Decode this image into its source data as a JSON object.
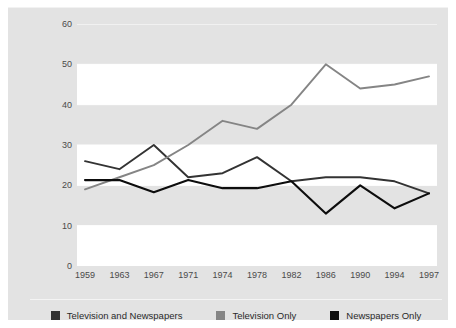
{
  "caption": "",
  "chart_data": {
    "type": "line",
    "title": "",
    "xlabel": "",
    "ylabel": "Percentage",
    "categories": [
      "1959",
      "1963",
      "1967",
      "1971",
      "1974",
      "1978",
      "1982",
      "1986",
      "1990",
      "1994",
      "1997"
    ],
    "x_tick_labels": [
      "1959",
      "1963",
      "1967",
      "1971",
      "1974",
      "1978",
      "1982",
      "1986",
      "1990",
      "1994",
      "1997"
    ],
    "y_tick_labels": [
      "0",
      "10",
      "20",
      "30",
      "40",
      "50",
      "60"
    ],
    "y_ticks": [
      0,
      10,
      20,
      30,
      40,
      50,
      60
    ],
    "ylim": [
      0,
      60
    ],
    "grid": "horizontal-bands",
    "legend_position": "bottom",
    "series": [
      {
        "name": "Television and Newspapers",
        "color": "#333333",
        "values": [
          26,
          24,
          30,
          22,
          23,
          27,
          21,
          22,
          22,
          21,
          18
        ]
      },
      {
        "name": "Television Only",
        "color": "#858585",
        "values": [
          19,
          22,
          25,
          30,
          36,
          34,
          40,
          50,
          44,
          45,
          47
        ]
      },
      {
        "name": "Newspapers Only",
        "color": "#0d0d0d",
        "values": [
          21.3,
          21.3,
          18.3,
          21.3,
          19.3,
          19.3,
          21,
          13,
          20,
          14.3,
          18
        ]
      }
    ]
  },
  "legend": {
    "items": [
      {
        "label": "Television and Newspapers",
        "color": "#333333"
      },
      {
        "label": "Television Only",
        "color": "#858585"
      },
      {
        "label": "Newspapers Only",
        "color": "#0d0d0d"
      }
    ]
  },
  "colors": {
    "panel_background": "#e3e3e3",
    "band_background": "#ffffff",
    "page_background": "#ffffff",
    "tick_text": "#4a4a4a"
  }
}
